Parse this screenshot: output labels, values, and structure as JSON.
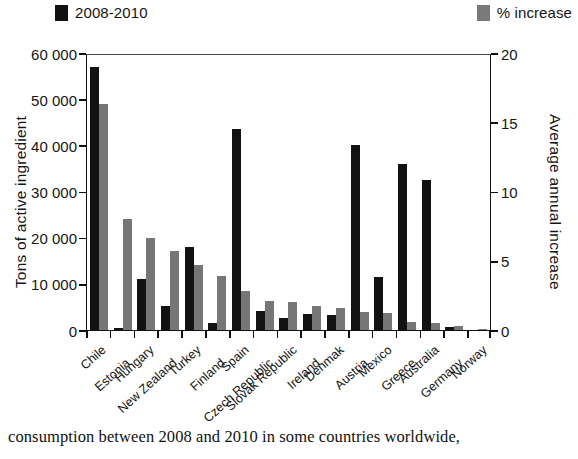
{
  "legend": {
    "series_black": "2008-2010",
    "series_gray": "% increase",
    "color_black": "#121212",
    "color_gray": "#767676"
  },
  "axes": {
    "left_title": "Tons of active ingredient",
    "right_title": "Average annual increase",
    "left_ticks": [
      "0",
      "10 000",
      "20 000",
      "30 000",
      "40 000",
      "50 000",
      "60 000"
    ],
    "right_ticks": [
      "0",
      "5",
      "10",
      "15",
      "20"
    ]
  },
  "caption": "consumption between 2008 and 2010 in some countries worldwide,",
  "chart_data": {
    "type": "bar",
    "title": "",
    "xlabel": "",
    "ylabel": "Tons of active ingredient",
    "y2label": "Average annual increase",
    "ylim": [
      0,
      60000
    ],
    "y2lim": [
      0,
      20
    ],
    "grid": false,
    "legend_position": "top",
    "categories": [
      "Chile",
      "Estonia",
      "Hungary",
      "New Zealand",
      "Turkey",
      "Finland",
      "Spain",
      "Czech Republic",
      "Slovak Republic",
      "Ireland",
      "Denmak",
      "Austria",
      "Mexico",
      "Greece",
      "Australia",
      "Germany",
      "Norway"
    ],
    "series": [
      {
        "name": "2008-2010",
        "axis": "left",
        "units": "tons of active ingredient",
        "color": "#121212",
        "values": [
          57000,
          400,
          11000,
          5300,
          18000,
          1500,
          43500,
          4200,
          2500,
          3400,
          3300,
          40000,
          11500,
          36000,
          32500,
          600,
          0
        ]
      },
      {
        "name": "% increase",
        "axis": "right",
        "units": "average annual increase (%)",
        "color": "#767676",
        "values_tons_scale": [
          49000,
          24000,
          20000,
          17200,
          14000,
          11800,
          8500,
          6300,
          6000,
          5300,
          4700,
          4000,
          3600,
          1700,
          1500,
          900,
          300
        ],
        "values": [
          16.3,
          8.0,
          6.7,
          5.7,
          4.7,
          3.9,
          2.8,
          2.1,
          2.0,
          1.8,
          1.6,
          1.3,
          1.2,
          0.6,
          0.5,
          0.3,
          0.1
        ]
      }
    ],
    "series_order_note": "black bar drawn left, gray bar drawn right within each category; Czech Republic onward both series use the small-value range"
  }
}
